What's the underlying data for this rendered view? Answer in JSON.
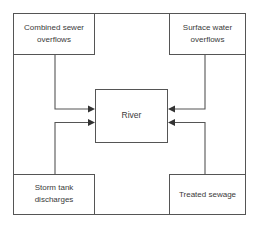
{
  "diagram": {
    "center": {
      "label": "River"
    },
    "sources": [
      {
        "id": "combined-sewer-overflows",
        "position": "top-left",
        "line1": "Combined sewer",
        "line2": "overflows"
      },
      {
        "id": "surface-water-overflows",
        "position": "top-right",
        "line1": "Surface water",
        "line2": "overflows"
      },
      {
        "id": "storm-tank-discharges",
        "position": "bottom-left",
        "line1": "Storm tank",
        "line2": "discharges"
      },
      {
        "id": "treated-sewage",
        "position": "bottom-right",
        "line1": "Treated sewage",
        "line2": ""
      }
    ],
    "connectors": [
      {
        "id": "connector-combined-sewer-to-river",
        "from": "combined-sewer-overflows",
        "to": "river",
        "direction": "right"
      },
      {
        "id": "connector-storm-tank-to-river",
        "from": "storm-tank-discharges",
        "to": "river",
        "direction": "right"
      },
      {
        "id": "connector-surface-water-to-river",
        "from": "surface-water-overflows",
        "to": "river",
        "direction": "left"
      },
      {
        "id": "connector-treated-sewage-to-river",
        "from": "treated-sewage",
        "to": "river",
        "direction": "left"
      }
    ],
    "colors": {
      "line": "#555555",
      "arrow": "#333333",
      "text": "#3a3a3a",
      "background": "#ffffff"
    }
  }
}
